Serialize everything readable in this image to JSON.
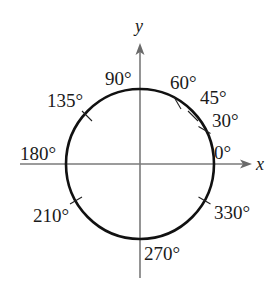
{
  "diagram": {
    "type": "unit-circle-angles",
    "axes": {
      "x_label": "x",
      "y_label": "y",
      "axis_color": "#7a7a7a"
    },
    "circle": {
      "color": "#111111"
    },
    "angles": [
      {
        "deg": 0,
        "label": "0°",
        "tick": false
      },
      {
        "deg": 30,
        "label": "30°",
        "tick": true
      },
      {
        "deg": 45,
        "label": "45°",
        "tick": true
      },
      {
        "deg": 60,
        "label": "60°",
        "tick": true
      },
      {
        "deg": 90,
        "label": "90°",
        "tick": false
      },
      {
        "deg": 135,
        "label": "135°",
        "tick": true
      },
      {
        "deg": 180,
        "label": "180°",
        "tick": false
      },
      {
        "deg": 210,
        "label": "210°",
        "tick": true
      },
      {
        "deg": 270,
        "label": "270°",
        "tick": false
      },
      {
        "deg": 330,
        "label": "330°",
        "tick": true
      }
    ]
  }
}
